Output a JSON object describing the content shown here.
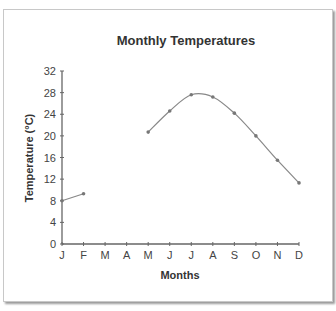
{
  "chart_data": {
    "type": "line",
    "title": "Monthly Temperatures",
    "xlabel": "Months",
    "ylabel": "Temperature (°C)",
    "categories": [
      "J",
      "F",
      "M",
      "A",
      "M",
      "J",
      "J",
      "A",
      "S",
      "O",
      "N",
      "D"
    ],
    "yticks": [
      0,
      4,
      8,
      12,
      16,
      20,
      24,
      28,
      32
    ],
    "ylim": [
      0,
      32
    ],
    "grid": false,
    "legend": "none",
    "series": [
      {
        "name": "Temperature",
        "values": [
          8.0,
          9.3,
          null,
          null,
          20.7,
          24.6,
          27.6,
          27.2,
          24.2,
          20.0,
          15.5,
          11.3
        ],
        "color": "#888888",
        "marker_color": "#777777"
      }
    ]
  }
}
